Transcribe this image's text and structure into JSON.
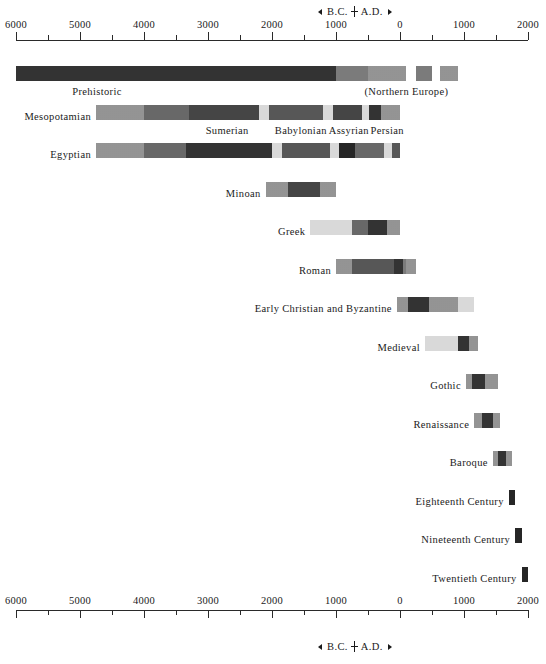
{
  "chart_data": {
    "type": "bar",
    "orientation": "horizontal-timeline",
    "xlabel": "Years",
    "ylabel": "",
    "xlim": [
      -6000,
      2000
    ],
    "axis": {
      "era_marker": {
        "arrow_left": "◄",
        "bc_label": "B.C.",
        "ad_label": "A.D.",
        "arrow_right": "►"
      },
      "major_ticks": [
        {
          "value": -6000,
          "label": "6000"
        },
        {
          "value": -5000,
          "label": "5000"
        },
        {
          "value": -4000,
          "label": "4000"
        },
        {
          "value": -3000,
          "label": "3000"
        },
        {
          "value": -2000,
          "label": "2000"
        },
        {
          "value": -1000,
          "label": "1000"
        },
        {
          "value": 0,
          "label": "0"
        },
        {
          "value": 1000,
          "label": "1000"
        },
        {
          "value": 2000,
          "label": "2000"
        }
      ],
      "minor_tick_values": [
        -5500,
        -4500,
        -3500,
        -2500,
        -1500,
        -500,
        500,
        1500
      ],
      "grid": false,
      "legend": "none"
    },
    "categories": [
      "Prehistoric",
      "Mesopotamian",
      "Egyptian",
      "Minoan",
      "Greek",
      "Roman",
      "Early Christian and Byzantine",
      "Medieval",
      "Gothic",
      "Renaissance",
      "Baroque",
      "Eighteenth Century",
      "Nineteenth Century",
      "Twentieth Century"
    ],
    "rows": [
      {
        "name": "Prehistoric",
        "label": "Prehistoric",
        "label_position": "inside-left",
        "start": -6000,
        "end": 1200,
        "annotations": [
          {
            "text": "(Northern Europe)",
            "at": 100
          }
        ],
        "segments": [
          {
            "start": -6000,
            "end": -1000,
            "tone": 80
          },
          {
            "start": -1000,
            "end": -500,
            "tone": 40
          },
          {
            "start": -500,
            "end": 100,
            "tone": 30
          },
          {
            "start": 250,
            "end": 500,
            "tone": 40
          },
          {
            "start": 620,
            "end": 900,
            "tone": 30
          }
        ]
      },
      {
        "name": "Mesopotamian",
        "label": "Mesopotamian",
        "label_position": "left-of-bar",
        "start": -4750,
        "end": 0,
        "segments": [
          {
            "start": -4750,
            "end": -4000,
            "tone": 30
          },
          {
            "start": -4000,
            "end": -3300,
            "tone": 50
          },
          {
            "start": -3300,
            "end": -2200,
            "tone": 70
          },
          {
            "start": -2200,
            "end": -2050,
            "tone": 20
          },
          {
            "start": -2050,
            "end": -1200,
            "tone": 60
          },
          {
            "start": -1200,
            "end": -1050,
            "tone": 20
          },
          {
            "start": -1050,
            "end": -600,
            "tone": 70
          },
          {
            "start": -600,
            "end": -480,
            "tone": 20
          },
          {
            "start": -480,
            "end": -300,
            "tone": 80
          },
          {
            "start": -300,
            "end": 0,
            "tone": 30
          }
        ],
        "sub_labels": [
          {
            "text": "Sumerian",
            "at": -2700
          },
          {
            "text": "Babylonian",
            "at": -1550
          },
          {
            "text": "Assyrian",
            "at": -800
          },
          {
            "text": "Persian",
            "at": -200
          }
        ]
      },
      {
        "name": "Egyptian",
        "label": "Egyptian",
        "label_position": "left-of-bar",
        "start": -4750,
        "end": 0,
        "segments": [
          {
            "start": -4750,
            "end": -4000,
            "tone": 30
          },
          {
            "start": -4000,
            "end": -3350,
            "tone": 50
          },
          {
            "start": -3350,
            "end": -2000,
            "tone": 80
          },
          {
            "start": -2000,
            "end": -1850,
            "tone": 20
          },
          {
            "start": -1850,
            "end": -1100,
            "tone": 60
          },
          {
            "start": -1100,
            "end": -950,
            "tone": 20
          },
          {
            "start": -950,
            "end": -700,
            "tone": 90
          },
          {
            "start": -700,
            "end": -250,
            "tone": 50
          },
          {
            "start": -250,
            "end": -120,
            "tone": 20
          },
          {
            "start": -120,
            "end": 0,
            "tone": 60
          }
        ]
      },
      {
        "name": "Minoan",
        "label": "Minoan",
        "label_position": "left-of-bar",
        "start": -2100,
        "end": -1000,
        "segments": [
          {
            "start": -2100,
            "end": -1750,
            "tone": 30
          },
          {
            "start": -1750,
            "end": -1250,
            "tone": 70
          },
          {
            "start": -1250,
            "end": -1000,
            "tone": 30
          }
        ]
      },
      {
        "name": "Greek",
        "label": "Greek",
        "label_position": "left-of-bar",
        "start": -1400,
        "end": 0,
        "segments": [
          {
            "start": -1400,
            "end": -750,
            "tone": 20
          },
          {
            "start": -750,
            "end": -500,
            "tone": 50
          },
          {
            "start": -500,
            "end": -200,
            "tone": 80
          },
          {
            "start": -200,
            "end": 0,
            "tone": 30
          }
        ]
      },
      {
        "name": "Roman",
        "label": "Roman",
        "label_position": "left-of-bar",
        "start": -1000,
        "end": 250,
        "segments": [
          {
            "start": -1000,
            "end": -750,
            "tone": 30
          },
          {
            "start": -750,
            "end": -100,
            "tone": 60
          },
          {
            "start": -100,
            "end": 50,
            "tone": 80
          },
          {
            "start": 50,
            "end": 100,
            "tone": 40
          },
          {
            "start": 100,
            "end": 250,
            "tone": 30
          }
        ]
      },
      {
        "name": "Early Christian and Byzantine",
        "label": "Early Christian and Byzantine",
        "label_position": "left-of-bar",
        "start": -50,
        "end": 1150,
        "segments": [
          {
            "start": -50,
            "end": 120,
            "tone": 30
          },
          {
            "start": 120,
            "end": 450,
            "tone": 80
          },
          {
            "start": 450,
            "end": 900,
            "tone": 30
          },
          {
            "start": 900,
            "end": 1150,
            "tone": 20
          }
        ]
      },
      {
        "name": "Medieval",
        "label": "Medieval",
        "label_position": "left-of-bar",
        "start": 390,
        "end": 1220,
        "segments": [
          {
            "start": 390,
            "end": 900,
            "tone": 20
          },
          {
            "start": 900,
            "end": 1080,
            "tone": 80
          },
          {
            "start": 1080,
            "end": 1220,
            "tone": 30
          }
        ]
      },
      {
        "name": "Gothic",
        "label": "Gothic",
        "label_position": "left-of-bar",
        "start": 1030,
        "end": 1530,
        "segments": [
          {
            "start": 1030,
            "end": 1130,
            "tone": 30
          },
          {
            "start": 1130,
            "end": 1330,
            "tone": 80
          },
          {
            "start": 1330,
            "end": 1530,
            "tone": 30
          }
        ]
      },
      {
        "name": "Renaissance",
        "label": "Renaissance",
        "label_position": "left-of-bar",
        "start": 1160,
        "end": 1570,
        "segments": [
          {
            "start": 1160,
            "end": 1280,
            "tone": 30
          },
          {
            "start": 1280,
            "end": 1450,
            "tone": 80
          },
          {
            "start": 1450,
            "end": 1570,
            "tone": 30
          }
        ]
      },
      {
        "name": "Baroque",
        "label": "Baroque",
        "label_position": "left-of-bar",
        "start": 1450,
        "end": 1750,
        "segments": [
          {
            "start": 1450,
            "end": 1530,
            "tone": 30
          },
          {
            "start": 1530,
            "end": 1660,
            "tone": 80
          },
          {
            "start": 1660,
            "end": 1750,
            "tone": 30
          }
        ]
      },
      {
        "name": "Eighteenth Century",
        "label": "Eighteenth Century",
        "label_position": "left-of-bar",
        "start": 1700,
        "end": 1800,
        "segments": [
          {
            "start": 1700,
            "end": 1800,
            "tone": 90
          }
        ]
      },
      {
        "name": "Nineteenth Century",
        "label": "Nineteenth Century",
        "label_position": "left-of-bar",
        "start": 1800,
        "end": 1900,
        "segments": [
          {
            "start": 1800,
            "end": 1900,
            "tone": 90
          }
        ]
      },
      {
        "name": "Twentieth Century",
        "label": "Twentieth Century",
        "label_position": "left-of-bar",
        "start": 1900,
        "end": 2000,
        "segments": [
          {
            "start": 1900,
            "end": 2000,
            "tone": 90
          }
        ]
      }
    ]
  }
}
